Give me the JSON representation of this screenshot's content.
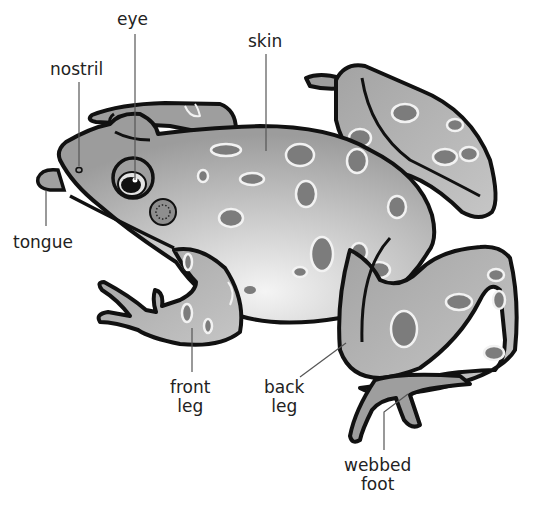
{
  "diagram": {
    "colors": {
      "outline": "#111111",
      "body_dark": "#9a9a9a",
      "body_light": "#f2f2f2",
      "spot_fill": "#7c7c7c",
      "spot_ring": "#f4f4f4",
      "leader_line": "#555555"
    },
    "labels": [
      {
        "id": "eye",
        "lines": [
          "eye"
        ]
      },
      {
        "id": "nostril",
        "lines": [
          "nostril"
        ]
      },
      {
        "id": "skin",
        "lines": [
          "skin"
        ]
      },
      {
        "id": "tongue",
        "lines": [
          "tongue"
        ]
      },
      {
        "id": "front-leg",
        "lines": [
          "front",
          "leg"
        ]
      },
      {
        "id": "back-leg",
        "lines": [
          "back",
          "leg"
        ]
      },
      {
        "id": "webbed-foot",
        "lines": [
          "webbed",
          "foot"
        ]
      }
    ]
  }
}
